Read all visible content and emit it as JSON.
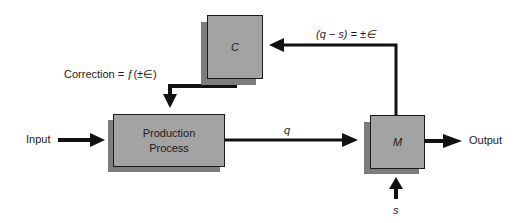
{
  "diagram": {
    "type": "feedback-control-block-diagram",
    "nodes": [
      {
        "id": "C",
        "label": "C",
        "italic": true,
        "role": "controller"
      },
      {
        "id": "production",
        "label_line1": "Production",
        "label_line2": "Process",
        "role": "process"
      },
      {
        "id": "M",
        "label": "M",
        "italic": true,
        "role": "measurement"
      }
    ],
    "labels": {
      "input": "Input",
      "output": "Output",
      "q": "q",
      "s": "s",
      "feedback": "(q − s) = ±∈",
      "correction": "Correction = ƒ(±∈)"
    },
    "edges": [
      {
        "from": "Input",
        "to": "production"
      },
      {
        "from": "production",
        "to": "M",
        "label": "q"
      },
      {
        "from": "M",
        "to": "Output"
      },
      {
        "from": "s",
        "to": "M",
        "label": "s"
      },
      {
        "from": "M",
        "to": "C",
        "label": "(q − s) = ±∈"
      },
      {
        "from": "C",
        "to": "production",
        "label": "Correction = ƒ(±∈)"
      }
    ],
    "colors": {
      "box_fill": "#a3a3a3",
      "box_shadow": "#7d7d7d",
      "line": "#111111",
      "background": "#ffffff"
    }
  }
}
